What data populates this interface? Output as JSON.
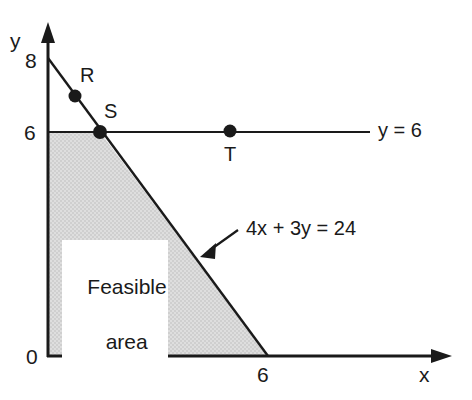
{
  "figure": {
    "kind": "linear-programming-feasible-region-diagram",
    "background_color": "#ffffff",
    "ink_color": "#1a1a1a",
    "shade_color": "#d9d9d9"
  },
  "axes": {
    "x_axis_label": "x",
    "y_axis_label": "y",
    "origin_label": "0",
    "x_ticks": [
      {
        "label": "6",
        "value": 6
      }
    ],
    "y_ticks": [
      {
        "label": "6",
        "value": 6
      },
      {
        "label": "8",
        "value": 8
      }
    ],
    "x_range": [
      0,
      8
    ],
    "y_range": [
      0,
      8.8
    ]
  },
  "lines": [
    {
      "name": "constraint-line",
      "label": "4x + 3y = 24",
      "equation": "4x + 3y = 24",
      "from": {
        "x": 0,
        "y": 8
      },
      "to": {
        "x": 6,
        "y": 0
      }
    },
    {
      "name": "y-equals-6-line",
      "label": "y = 6",
      "equation": "y = 6",
      "from": {
        "x": 0,
        "y": 6
      },
      "to": {
        "x": 8.6,
        "y": 6
      }
    }
  ],
  "points": [
    {
      "label": "R",
      "x": 0.75,
      "y": 7
    },
    {
      "label": "S",
      "x": 1.5,
      "y": 6
    },
    {
      "label": "T",
      "x": 5.1,
      "y": 6
    }
  ],
  "region": {
    "label_line1": "Feasible",
    "label_line2": "area",
    "vertices": [
      {
        "x": 0,
        "y": 6
      },
      {
        "x": 1.5,
        "y": 6
      },
      {
        "x": 6,
        "y": 0
      },
      {
        "x": 0,
        "y": 0
      }
    ]
  }
}
